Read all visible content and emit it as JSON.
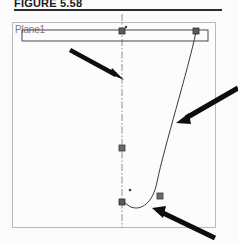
{
  "figure": {
    "caption": "FIGURE 5.58",
    "rule_color": "#2b2b2b"
  },
  "canvas": {
    "name": "cad-sketch-canvas",
    "border_color": "#b9b9bd",
    "background": "#fcfcfc"
  },
  "sketch": {
    "plane_label": "Plane1",
    "plane_label_color": "#7b7b80",
    "geometry_color": "#3a3a3a",
    "centerline_color": "#8e8e96",
    "point_marker_color": "#4a4a4a",
    "entities": [
      {
        "name": "rectangle",
        "type": "rectangle",
        "x": 22,
        "y": 30,
        "width": 186,
        "height": 11
      },
      {
        "name": "vertical-centerline",
        "type": "centerline",
        "x": 122,
        "y1": 14,
        "y2": 228,
        "style": "dash-dot"
      },
      {
        "name": "spline-curve",
        "type": "spline",
        "path": "M 196 32 C 186 72, 162 150, 156 184 C 152 205, 140 210, 130 206 C 124 203, 122 200, 122 199"
      }
    ],
    "points": [
      {
        "name": "point-top-center",
        "x": 122,
        "y": 31,
        "kind": "square"
      },
      {
        "name": "point-top-center-small",
        "x": 125,
        "y": 27,
        "kind": "dot"
      },
      {
        "name": "point-top-right",
        "x": 196,
        "y": 31,
        "kind": "square"
      },
      {
        "name": "point-mid-center",
        "x": 122,
        "y": 148,
        "kind": "square"
      },
      {
        "name": "point-lower-dot",
        "x": 130,
        "y": 190,
        "kind": "dot"
      },
      {
        "name": "point-bottom-left",
        "x": 122,
        "y": 202,
        "kind": "square"
      },
      {
        "name": "point-bottom-right",
        "x": 160,
        "y": 196,
        "kind": "square"
      }
    ],
    "annotation_arrows": [
      {
        "name": "arrow-centerline",
        "from_x": 70,
        "from_y": 50,
        "to_x": 122,
        "to_y": 79,
        "target": "vertical-centerline"
      },
      {
        "name": "arrow-spline-upper",
        "from_x": 234,
        "from_y": 91,
        "to_x": 176,
        "to_y": 122,
        "target": "spline-curve"
      },
      {
        "name": "arrow-spline-bottom",
        "from_x": 209,
        "from_y": 234,
        "to_x": 152,
        "to_y": 208,
        "target": "spline-curve"
      }
    ],
    "arrow_color": "#0d0d0d"
  }
}
